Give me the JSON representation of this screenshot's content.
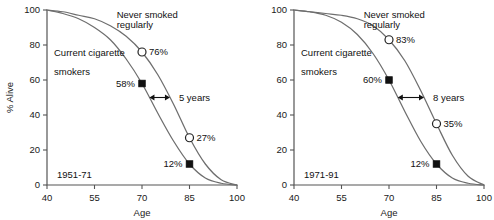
{
  "figure": {
    "title": "",
    "background": "#ffffff",
    "curve_color": "#6e6e6e",
    "text_color": "#111111"
  },
  "axes": {
    "xlabel": "Age",
    "ylabel": "% Alive",
    "xticks": [
      "40",
      "55",
      "70",
      "85",
      "100"
    ],
    "yticks": [
      "0",
      "20",
      "40",
      "60",
      "80",
      "100"
    ],
    "xlim": [
      40,
      100
    ],
    "ylim": [
      0,
      100
    ]
  },
  "labels": {
    "never_line1": "Never smoked",
    "never_line2": "regularly",
    "smokers_line1": "Current cigarette",
    "smokers_line2": "smokers"
  },
  "panels": [
    {
      "id": "left",
      "period": "1951-71",
      "gap_label": "5 years",
      "markers": [
        {
          "name": "never-70",
          "age": 70,
          "value": 76,
          "label": "76%",
          "style": "open",
          "label_side": "right"
        },
        {
          "name": "never-85",
          "age": 85,
          "value": 27,
          "label": "27%",
          "style": "open",
          "label_side": "right"
        },
        {
          "name": "smoker-70",
          "age": 70,
          "value": 58,
          "label": "58%",
          "style": "filled",
          "label_side": "left"
        },
        {
          "name": "smoker-85",
          "age": 85,
          "value": 12,
          "label": "12%",
          "style": "filled",
          "label_side": "left"
        }
      ]
    },
    {
      "id": "right",
      "period": "1971-91",
      "gap_label": "8 years",
      "markers": [
        {
          "name": "never-70",
          "age": 70,
          "value": 83,
          "label": "83%",
          "style": "open",
          "label_side": "right"
        },
        {
          "name": "never-85",
          "age": 85,
          "value": 35,
          "label": "35%",
          "style": "open",
          "label_side": "right"
        },
        {
          "name": "smoker-70",
          "age": 70,
          "value": 60,
          "label": "60%",
          "style": "filled",
          "label_side": "left"
        },
        {
          "name": "smoker-85",
          "age": 85,
          "value": 12,
          "label": "12%",
          "style": "filled",
          "label_side": "left"
        }
      ]
    }
  ],
  "chart_data": [
    {
      "type": "line",
      "title": "1951-71",
      "xlabel": "Age",
      "ylabel": "% Alive",
      "xlim": [
        40,
        100
      ],
      "ylim": [
        0,
        100
      ],
      "xticks": [
        40,
        55,
        70,
        85,
        100
      ],
      "yticks": [
        0,
        20,
        40,
        60,
        80,
        100
      ],
      "grid": false,
      "legend": "annotations-on-plot",
      "x": [
        40,
        45,
        50,
        55,
        60,
        65,
        70,
        75,
        80,
        85,
        90,
        95,
        100
      ],
      "series": [
        {
          "name": "Never smoked regularly",
          "values": [
            100,
            99,
            97,
            95,
            91,
            85,
            76,
            63,
            46,
            27,
            12,
            3,
            0
          ],
          "marker_ages": [
            70,
            85
          ],
          "marker_values": [
            76,
            27
          ],
          "marker_style": "open-circle"
        },
        {
          "name": "Current cigarette smokers",
          "values": [
            100,
            98,
            95,
            90,
            83,
            72,
            58,
            41,
            25,
            12,
            4,
            1,
            0
          ],
          "marker_ages": [
            70,
            85
          ],
          "marker_values": [
            58,
            12
          ],
          "marker_style": "filled-square"
        }
      ],
      "annotations": [
        {
          "text": "5 years",
          "type": "double-arrow",
          "meaning": "horizontal gap between curves at 50% alive"
        },
        {
          "text": "1951-71",
          "type": "period-label"
        }
      ]
    },
    {
      "type": "line",
      "title": "1971-91",
      "xlabel": "Age",
      "ylabel": "% Alive",
      "xlim": [
        40,
        100
      ],
      "ylim": [
        0,
        100
      ],
      "xticks": [
        40,
        55,
        70,
        85,
        100
      ],
      "yticks": [
        0,
        20,
        40,
        60,
        80,
        100
      ],
      "grid": false,
      "legend": "annotations-on-plot",
      "x": [
        40,
        45,
        50,
        55,
        60,
        65,
        70,
        75,
        80,
        85,
        90,
        95,
        100
      ],
      "series": [
        {
          "name": "Never smoked regularly",
          "values": [
            100,
            99,
            98,
            97,
            95,
            91,
            83,
            71,
            54,
            35,
            17,
            5,
            0
          ],
          "marker_ages": [
            70,
            85
          ],
          "marker_values": [
            83,
            35
          ],
          "marker_style": "open-circle"
        },
        {
          "name": "Current cigarette smokers",
          "values": [
            100,
            99,
            97,
            93,
            86,
            75,
            60,
            42,
            25,
            12,
            4,
            1,
            0
          ],
          "marker_ages": [
            70,
            85
          ],
          "marker_values": [
            60,
            12
          ],
          "marker_style": "filled-square"
        }
      ],
      "annotations": [
        {
          "text": "8 years",
          "type": "double-arrow",
          "meaning": "horizontal gap between curves at 50% alive"
        },
        {
          "text": "1971-91",
          "type": "period-label"
        }
      ]
    }
  ]
}
